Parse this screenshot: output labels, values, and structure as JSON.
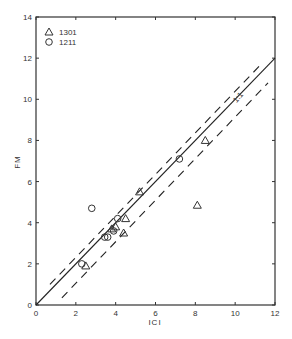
{
  "chart_data": {
    "type": "scatter",
    "title": "",
    "xlabel": "ICI",
    "ylabel": "FM",
    "xlim": [
      0,
      12
    ],
    "ylim": [
      0,
      14
    ],
    "xticks": [
      0,
      2,
      4,
      6,
      8,
      10,
      12
    ],
    "yticks": [
      0,
      2,
      4,
      6,
      8,
      10,
      12,
      14
    ],
    "xtick_labels": [
      "0",
      "2",
      "4",
      "6",
      "8",
      "10",
      "12"
    ],
    "ytick_labels": [
      "0",
      "2",
      "4",
      "6",
      "8",
      "10",
      "12",
      "14"
    ],
    "grid": false,
    "legend_position": "upper left",
    "series": [
      {
        "name": "1301",
        "marker": "triangle",
        "points": [
          {
            "x": 2.5,
            "y": 1.9
          },
          {
            "x": 3.8,
            "y": 3.7
          },
          {
            "x": 4.0,
            "y": 3.8
          },
          {
            "x": 4.4,
            "y": 3.5
          },
          {
            "x": 4.5,
            "y": 4.2
          },
          {
            "x": 5.2,
            "y": 5.5
          },
          {
            "x": 8.1,
            "y": 4.85
          },
          {
            "x": 8.5,
            "y": 8.0
          }
        ]
      },
      {
        "name": "1211",
        "marker": "circle",
        "points": [
          {
            "x": 2.3,
            "y": 2.0
          },
          {
            "x": 2.8,
            "y": 4.7
          },
          {
            "x": 3.45,
            "y": 3.3
          },
          {
            "x": 3.6,
            "y": 3.3
          },
          {
            "x": 3.9,
            "y": 3.6
          },
          {
            "x": 4.1,
            "y": 4.2
          },
          {
            "x": 7.2,
            "y": 7.1
          }
        ]
      }
    ],
    "lines": [
      {
        "name": "1:1",
        "style": "solid",
        "from": [
          0,
          0
        ],
        "to": [
          12,
          12
        ]
      },
      {
        "name": "upper bound",
        "style": "dashed",
        "from": [
          0.7,
          1.0
        ],
        "to": [
          11.3,
          11.7
        ]
      },
      {
        "name": "lower bound",
        "style": "dashed",
        "from": [
          1.3,
          0.35
        ],
        "to": [
          11.65,
          10.8
        ]
      }
    ],
    "annotations": [
      {
        "text": "1:1",
        "x": 10.2,
        "y": 10.0
      }
    ]
  },
  "labels": {
    "xlabel": "ICI",
    "ylabel": "FM",
    "legend_1301": "1301",
    "legend_1211": "1211",
    "one_to_one": "1:1"
  }
}
